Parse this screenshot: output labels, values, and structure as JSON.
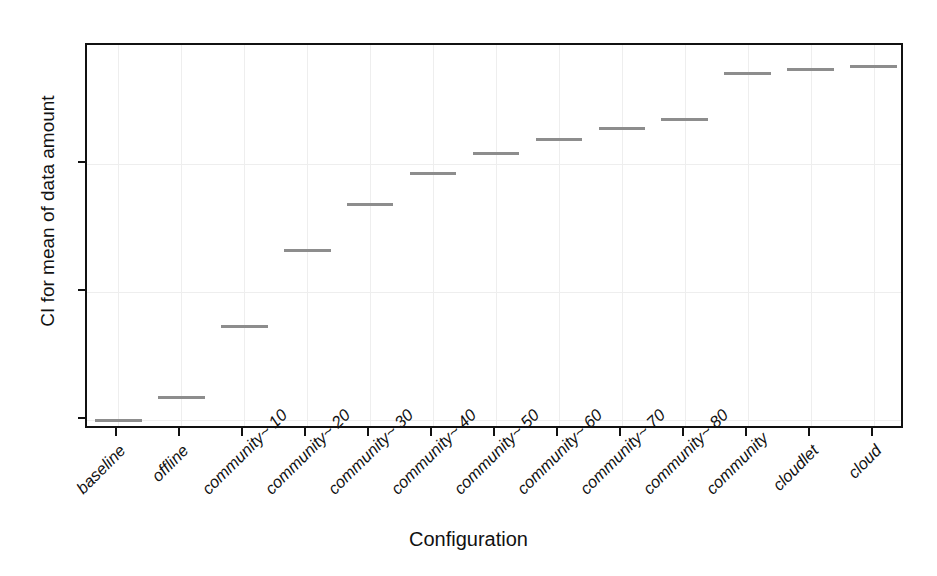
{
  "chart_data": {
    "type": "bar",
    "title": "",
    "xlabel": "Configuration",
    "ylabel": "CI for mean of data amount",
    "categories": [
      "baseline",
      "offline",
      "community~ 10",
      "community~ 20",
      "community~ 30",
      "community~ 40",
      "community~ 50",
      "community~ 60",
      "community~ 70",
      "community~ 80",
      "community",
      "cloudlet",
      "cloud"
    ],
    "values": [
      0.0,
      3.6,
      14.6,
      26.4,
      33.7,
      38.4,
      41.6,
      43.8,
      45.5,
      46.9,
      54.1,
      54.7,
      55.2
    ],
    "ylim": [
      -1.5,
      58.5
    ],
    "yticks": [
      0,
      20,
      40
    ],
    "ytick_labels": [
      "0",
      "20",
      "40"
    ],
    "grid": true,
    "legend": "none",
    "marker_color": "#8d8d8d",
    "axis_color": "#111111",
    "background_color": "#ffffff",
    "grid_color": "#eeeeee"
  }
}
